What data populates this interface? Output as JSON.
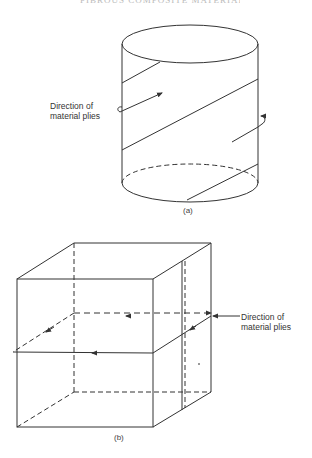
{
  "header": {
    "running_title": "FIBROUS COMPOSITE MATERIALS"
  },
  "figure_a": {
    "shape": "cylinder",
    "caption": "(a)",
    "annotation": {
      "line1": "Direction of",
      "line2": "material plies"
    }
  },
  "figure_b": {
    "shape": "cube",
    "caption": "(b)",
    "annotation": {
      "line1": "Direction of",
      "line2": "material plies"
    }
  },
  "colors": {
    "line": "#333333",
    "background": "#ffffff"
  }
}
